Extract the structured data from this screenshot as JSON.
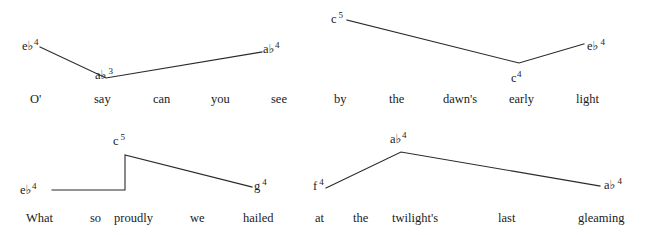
{
  "figure": {
    "background_color": "#ffffff",
    "line_color": "#2a2a2a",
    "text_color": "#1a1a1a"
  },
  "panels": [
    {
      "id": "panel-1",
      "lyrics": [
        {
          "text": "O'",
          "x": 30,
          "y": 93
        },
        {
          "text": "say",
          "x": 94,
          "y": 93
        },
        {
          "text": "can",
          "x": 153,
          "y": 93
        },
        {
          "text": "you",
          "x": 211,
          "y": 93
        },
        {
          "text": "see",
          "x": 271,
          "y": 93
        }
      ],
      "notes": [
        {
          "pitch": "e",
          "accidental": "♭",
          "octave": "4",
          "x": 22,
          "y": 38,
          "gap": false
        },
        {
          "pitch": "a",
          "accidental": "♭",
          "octave": "3",
          "x": 95,
          "y": 67,
          "gap": true
        },
        {
          "pitch": "a",
          "accidental": "♭",
          "octave": "4",
          "x": 263,
          "y": 41,
          "gap": false
        }
      ],
      "contour": "M 40,47 L 106,78 L 262,52"
    },
    {
      "id": "panel-2",
      "lyrics": [
        {
          "text": "by",
          "x": 334,
          "y": 93
        },
        {
          "text": "the",
          "x": 389,
          "y": 93
        },
        {
          "text": "dawn's",
          "x": 443,
          "y": 93
        },
        {
          "text": "early",
          "x": 509,
          "y": 93
        },
        {
          "text": "light",
          "x": 576,
          "y": 93
        }
      ],
      "notes": [
        {
          "pitch": "c",
          "accidental": "",
          "octave": "5",
          "x": 331,
          "y": 11,
          "gap": true
        },
        {
          "pitch": "c",
          "accidental": "",
          "octave": "4",
          "x": 511,
          "y": 70,
          "gap": false
        },
        {
          "pitch": "e",
          "accidental": "♭",
          "octave": "4",
          "x": 587,
          "y": 38,
          "gap": true
        }
      ],
      "contour": "M 347,20 L 519,63 L 584,44"
    },
    {
      "id": "panel-3",
      "lyrics": [
        {
          "text": "What",
          "x": 26,
          "y": 212
        },
        {
          "text": "so",
          "x": 90,
          "y": 212
        },
        {
          "text": "proudly",
          "x": 114,
          "y": 212
        },
        {
          "text": "we",
          "x": 190,
          "y": 212
        },
        {
          "text": "hailed",
          "x": 243,
          "y": 212
        }
      ],
      "notes": [
        {
          "pitch": "e",
          "accidental": "♭",
          "octave": "4",
          "x": 20,
          "y": 182,
          "gap": false
        },
        {
          "pitch": "c",
          "accidental": "",
          "octave": "5",
          "x": 113,
          "y": 133,
          "gap": true
        },
        {
          "pitch": "g",
          "accidental": "",
          "octave": "4",
          "x": 254,
          "y": 178,
          "gap": true
        }
      ],
      "contour": "M 52,190 L 125,190 L 125,155 L 252,187"
    },
    {
      "id": "panel-4",
      "lyrics": [
        {
          "text": "at",
          "x": 315,
          "y": 212
        },
        {
          "text": "the",
          "x": 353,
          "y": 212
        },
        {
          "text": "twilight's",
          "x": 392,
          "y": 212
        },
        {
          "text": "last",
          "x": 498,
          "y": 212
        },
        {
          "text": "gleaming",
          "x": 578,
          "y": 212
        }
      ],
      "notes": [
        {
          "pitch": "f",
          "accidental": "",
          "octave": "4",
          "x": 313,
          "y": 178,
          "gap": true
        },
        {
          "pitch": "a",
          "accidental": "♭",
          "octave": "4",
          "x": 390,
          "y": 131,
          "gap": false
        },
        {
          "pitch": "a",
          "accidental": "♭",
          "octave": "4",
          "x": 604,
          "y": 177,
          "gap": true
        }
      ],
      "contour": "M 326,188 L 401,152 L 600,186"
    }
  ]
}
